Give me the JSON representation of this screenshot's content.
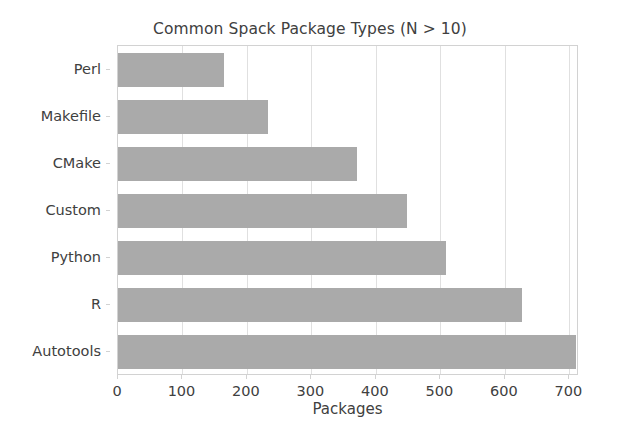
{
  "chart_data": {
    "type": "bar",
    "orientation": "horizontal",
    "title": "Common Spack Package Types (N > 10)",
    "xlabel": "Packages",
    "ylabel": "",
    "categories": [
      "Perl",
      "Makefile",
      "CMake",
      "Custom",
      "Python",
      "R",
      "Autotools"
    ],
    "values": [
      164,
      232,
      371,
      448,
      509,
      626,
      710
    ],
    "xlim": [
      0,
      715
    ],
    "xticks": [
      0,
      100,
      200,
      300,
      400,
      500,
      600,
      700
    ],
    "xtick_labels": [
      "0",
      "100",
      "200",
      "300",
      "400",
      "500",
      "600",
      "700"
    ],
    "grid": "vertical",
    "legend": null,
    "bar_color": "#aaaaaa",
    "axis_color": "#d2d2d2",
    "grid_color": "#e0e0e0",
    "text_color": "#404040"
  }
}
